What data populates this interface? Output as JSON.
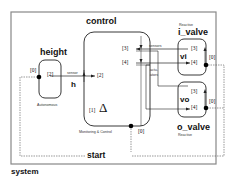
{
  "diagram": {
    "container_label": "system",
    "components": {
      "height": {
        "title": "height",
        "kind": "Autonomous",
        "var": "h",
        "ports": {
          "in0": "[0]",
          "out2": "[2]"
        }
      },
      "control": {
        "title": "control",
        "kind": "Monitoring & Control",
        "ports": {
          "in2": "[2]",
          "p3": "[3]",
          "p4": "[4]",
          "p1": "[1]",
          "in0": "[0]"
        },
        "symbol": "Δ"
      },
      "i_valve": {
        "title": "i_valve",
        "kind": "Reactive",
        "var": "vi",
        "ports": {
          "p3": "[3]",
          "p4": "[4]",
          "p0": "[0]"
        }
      },
      "o_valve": {
        "title": "o_valve",
        "kind": "Reactive",
        "var": "vo",
        "ports": {
          "p3": "[3]",
          "p4": "[4]",
          "p0": "[0]"
        }
      }
    },
    "edge_labels": {
      "sensor": "sensor",
      "sensors": "sensors",
      "actuators_1": "actu-",
      "actuators_2": "ators",
      "start": "start"
    }
  }
}
